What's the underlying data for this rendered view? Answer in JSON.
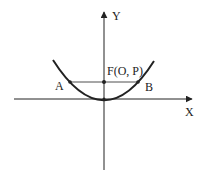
{
  "diagram": {
    "type": "parabola-focal-chord",
    "axes": {
      "x_label": "X",
      "y_label": "Y"
    },
    "focus_label": "F(O, P)",
    "points": {
      "A": "A",
      "B": "B"
    },
    "colors": {
      "stroke": "#222222",
      "background": "#ffffff"
    }
  }
}
